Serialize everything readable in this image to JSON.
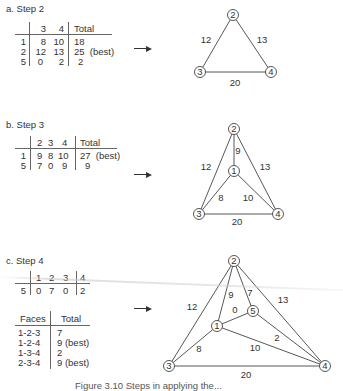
{
  "panels": [
    {
      "title": "a. Step 2",
      "table": {
        "headers": [
          "",
          "3",
          "4",
          "Total"
        ],
        "rows": [
          [
            "1",
            "8",
            "10",
            "18"
          ],
          [
            "2",
            "12",
            "13",
            "25  (best)"
          ],
          [
            "5",
            "0",
            "2",
            "2"
          ]
        ]
      },
      "graph": {
        "nodes": [
          {
            "id": "2",
            "x": 233,
            "y": 15
          },
          {
            "id": "3",
            "x": 200,
            "y": 72
          },
          {
            "id": "4",
            "x": 271,
            "y": 72
          }
        ],
        "edges": [
          {
            "from": "2",
            "to": "3",
            "weight": "12",
            "lx": 206,
            "ly": 43
          },
          {
            "from": "2",
            "to": "4",
            "weight": "13",
            "lx": 262,
            "ly": 43
          },
          {
            "from": "3",
            "to": "4",
            "weight": "20",
            "lx": 235,
            "ly": 86
          }
        ]
      }
    },
    {
      "title": "b. Step 3",
      "table": {
        "headers": [
          "",
          "2",
          "3",
          "4",
          "Total"
        ],
        "rows": [
          [
            "1",
            "9",
            "8",
            "10",
            "27  (best)"
          ],
          [
            "5",
            "7",
            "0",
            "9",
            "9"
          ]
        ]
      },
      "graph": {
        "nodes": [
          {
            "id": "2",
            "x": 234,
            "y": 129
          },
          {
            "id": "1",
            "x": 234,
            "y": 171
          },
          {
            "id": "3",
            "x": 199,
            "y": 214
          },
          {
            "id": "4",
            "x": 278,
            "y": 214
          }
        ],
        "edges": [
          {
            "from": "2",
            "to": "1",
            "weight": "9",
            "lx": 238,
            "ly": 154
          },
          {
            "from": "2",
            "to": "3",
            "weight": "12",
            "lx": 206,
            "ly": 170
          },
          {
            "from": "2",
            "to": "4",
            "weight": "13",
            "lx": 265,
            "ly": 170
          },
          {
            "from": "1",
            "to": "3",
            "weight": "8",
            "lx": 221,
            "ly": 201
          },
          {
            "from": "1",
            "to": "4",
            "weight": "10",
            "lx": 248,
            "ly": 201
          },
          {
            "from": "3",
            "to": "4",
            "weight": "20",
            "lx": 237,
            "ly": 225
          }
        ]
      }
    },
    {
      "title": "c. Step 4",
      "table": {
        "headers": [
          "",
          "1",
          "2",
          "3",
          "4"
        ],
        "rows": [
          [
            "5",
            "0",
            "7",
            "0",
            "2"
          ]
        ]
      },
      "faces_table": {
        "headers": [
          "Faces",
          "Total"
        ],
        "rows": [
          [
            "1-2-3",
            "7"
          ],
          [
            "1-2-4",
            "9 (best)"
          ],
          [
            "1-3-4",
            "2"
          ],
          [
            "2-3-4",
            "9 (best)"
          ]
        ]
      },
      "graph": {
        "nodes": [
          {
            "id": "2",
            "x": 234,
            "y": 261
          },
          {
            "id": "5",
            "x": 253,
            "y": 311
          },
          {
            "id": "1",
            "x": 217,
            "y": 326
          },
          {
            "id": "3",
            "x": 169,
            "y": 366
          },
          {
            "id": "4",
            "x": 325,
            "y": 366
          }
        ],
        "edges": [
          {
            "from": "2",
            "to": "3",
            "weight": "12",
            "lx": 192,
            "ly": 310
          },
          {
            "from": "2",
            "to": "4",
            "weight": "13",
            "lx": 283,
            "ly": 303
          },
          {
            "from": "2",
            "to": "1",
            "weight": "9",
            "lx": 231,
            "ly": 298
          },
          {
            "from": "2",
            "to": "5",
            "weight": "7",
            "lx": 250,
            "ly": 296
          },
          {
            "from": "1",
            "to": "5",
            "weight": "0",
            "lx": 235,
            "ly": 313
          },
          {
            "from": "5",
            "to": "4",
            "weight": "2",
            "lx": 277,
            "ly": 341
          },
          {
            "from": "1",
            "to": "3",
            "weight": "8",
            "lx": 199,
            "ly": 352
          },
          {
            "from": "1",
            "to": "4",
            "weight": "10",
            "lx": 255,
            "ly": 351
          },
          {
            "from": "3",
            "to": "4",
            "weight": "20",
            "lx": 246,
            "ly": 378
          }
        ]
      }
    }
  ],
  "arrows": [
    {
      "x": 134,
      "y": 46
    },
    {
      "x": 134,
      "y": 172
    },
    {
      "x": 134,
      "y": 306
    }
  ],
  "caption": "Figure 3.10   Steps in applying the...",
  "colors": {
    "ink": "#333333",
    "line": "#444444",
    "background": "#ffffff"
  }
}
